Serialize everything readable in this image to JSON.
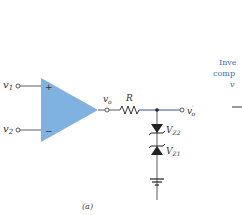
{
  "diagram": {
    "inputs": [
      {
        "label": "v",
        "sub": "1",
        "sign": "+"
      },
      {
        "label": "v",
        "sub": "2",
        "sign": "−"
      }
    ],
    "output_node": {
      "label": "v",
      "sub": "o"
    },
    "resistor": {
      "label": "R"
    },
    "output_prime": {
      "label": "v",
      "sub": "o",
      "prime": "′"
    },
    "zeners": [
      {
        "label": "V",
        "sub": "Z2"
      },
      {
        "label": "V",
        "sub": "Z1"
      }
    ],
    "caption": "(a)",
    "side_text": [
      "Inve",
      "comp",
      "v"
    ],
    "colors": {
      "opamp_fill": "#7fb2e0",
      "wire": "#333333",
      "blue_wire": "#3a4fa8",
      "side_text": "#3a6fb0"
    }
  }
}
